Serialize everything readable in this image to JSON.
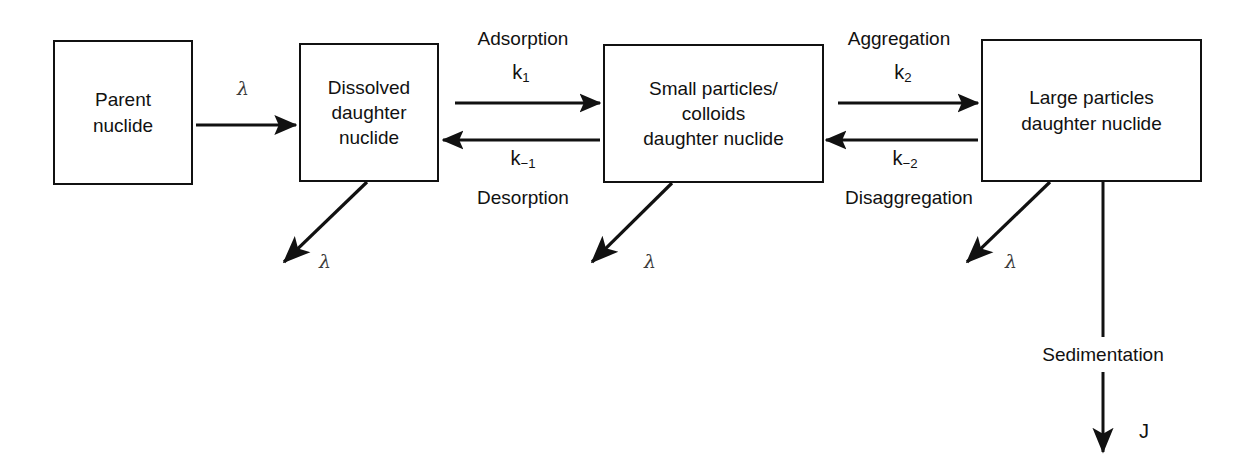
{
  "diagram": {
    "stroke_color": "#111111",
    "background_color": "#ffffff",
    "lambda_color": "#3b3b3b",
    "boxes": [
      {
        "id": "parent",
        "label": "Parent\nnuclide"
      },
      {
        "id": "dissolved",
        "label": "Dissolved\ndaughter\nnuclide"
      },
      {
        "id": "small-particles",
        "label": "Small particles/\ncolloids\ndaughter nuclide"
      },
      {
        "id": "large-particles",
        "label": "Large particles\ndaughter nuclide"
      }
    ],
    "process_labels": {
      "adsorption": "Adsorption",
      "desorption": "Desorption",
      "aggregation": "Aggregation",
      "disaggregation": "Disaggregation",
      "sedimentation": "Sedimentation"
    },
    "rate_constants": {
      "k1_forward": "k",
      "k1_forward_sub": "1",
      "k1_reverse": "k",
      "k1_reverse_sub": "−1",
      "k2_forward": "k",
      "k2_forward_sub": "2",
      "k2_reverse": "k",
      "k2_reverse_sub": "−2"
    },
    "decay_symbol": "λ",
    "flux_symbol": "J",
    "decay_labels": [
      {
        "id": "decay-parent-to-dissolved",
        "symbol": "λ"
      },
      {
        "id": "decay-dissolved",
        "symbol": "λ"
      },
      {
        "id": "decay-small-particles",
        "symbol": "λ"
      },
      {
        "id": "decay-large-particles",
        "symbol": "λ"
      }
    ]
  }
}
